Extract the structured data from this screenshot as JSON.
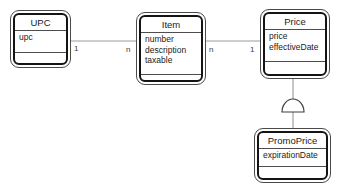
{
  "diagram": {
    "background": "#ffffff",
    "colors": {
      "connector": "#9a9a9a",
      "generalization_line": "#8c8c8c",
      "symbol_stroke": "#3f3f3f",
      "symbol_fill": "#ffffff",
      "box_border": "#141414",
      "text": "#1a1a1a"
    },
    "entities": [
      {
        "name": "UPC",
        "attributes": [
          "upc"
        ]
      },
      {
        "name": "Item",
        "attributes": [
          "number",
          "description",
          "taxable"
        ]
      },
      {
        "name": "Price",
        "attributes": [
          "price",
          "effectiveDate"
        ]
      },
      {
        "name": "PromoPrice",
        "attributes": [
          "expirationDate"
        ]
      }
    ],
    "relationships": [
      {
        "from": "UPC",
        "to": "Item",
        "from_cardinality": "1",
        "to_cardinality": "n"
      },
      {
        "from": "Item",
        "to": "Price",
        "from_cardinality": "n",
        "to_cardinality": "1"
      },
      {
        "from": "Price",
        "to": "PromoPrice",
        "type": "generalization",
        "symbol": "semicircle"
      }
    ]
  }
}
